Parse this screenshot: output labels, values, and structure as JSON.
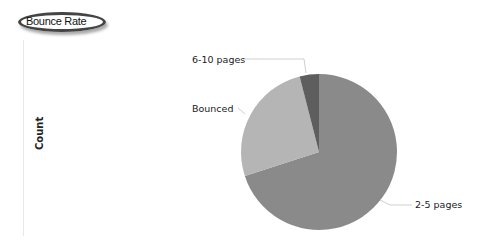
{
  "title": "Bounce Rate",
  "ylabel": "Count",
  "labels": {
    "six_ten": "6-10 pages",
    "bounced": "Bounced",
    "two_five": "2-5 pages"
  },
  "chart_data": {
    "type": "pie",
    "title": "Bounce Rate",
    "xlabel": "",
    "ylabel": "Count",
    "categories": [
      "2-5 pages",
      "Bounced",
      "6-10 pages"
    ],
    "values": [
      70,
      26,
      4
    ],
    "units": "approximate percent share (no values shown)",
    "colors": [
      "#8a8a8a",
      "#b5b5b5",
      "#5e5e5e"
    ],
    "legend": "none (callout labels)"
  }
}
